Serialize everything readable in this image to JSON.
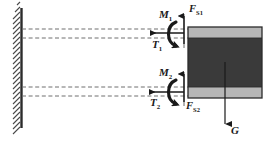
{
  "figure": {
    "type": "free-body-diagram",
    "title": "",
    "colors": {
      "wall_line": "#2b2b2b",
      "hatch": "#555555",
      "block_body": "#3a3a3a",
      "block_band": "#b6b6b6",
      "block_outline": "#2b2b2b",
      "dashed_line": "#6e6e6e",
      "arrow": "#1a1a1a",
      "label_text": "#1a1a1a",
      "background": "#ffffff"
    },
    "wall": {
      "label": "fixed-support-wall",
      "x": 21,
      "y_top": 8,
      "y_bottom": 128,
      "hatch_width": 9,
      "hatch_count": 26
    },
    "block": {
      "label": "body-block",
      "x": 188,
      "y": 27,
      "width": 74,
      "height": 71,
      "band_top_height": 11,
      "band_bottom_height": 11
    },
    "axes": [
      {
        "name": "upper-axis-line-1",
        "y": 29
      },
      {
        "name": "upper-axis-line-2",
        "y": 38
      },
      {
        "name": "lower-axis-line-1",
        "y": 87
      },
      {
        "name": "lower-axis-line-2",
        "y": 96
      }
    ],
    "labels": [
      {
        "id": "moment-upper",
        "name": "M1",
        "symbol": "M",
        "subscript": "1",
        "x": 159,
        "y": 9,
        "style": "main",
        "description": "Upper torsional moment"
      },
      {
        "id": "shear-upper",
        "name": "FS1",
        "symbol": "F",
        "subscript": "S1",
        "x": 189,
        "y": 4,
        "style": "force",
        "description": "Upper shear force"
      },
      {
        "id": "tension-upper",
        "name": "T1",
        "symbol": "T",
        "subscript": "1",
        "x": 152,
        "y": 39,
        "style": "main",
        "description": "Upper axial/tension force"
      },
      {
        "id": "moment-lower",
        "name": "M2",
        "symbol": "M",
        "subscript": "2",
        "x": 159,
        "y": 67,
        "style": "main",
        "description": "Lower torsional moment"
      },
      {
        "id": "tension-lower",
        "name": "T2",
        "symbol": "T",
        "subscript": "2",
        "x": 150,
        "y": 97,
        "style": "main",
        "description": "Lower axial/tension force"
      },
      {
        "id": "shear-lower",
        "name": "FS2",
        "symbol": "F",
        "subscript": "S2",
        "x": 186,
        "y": 101,
        "style": "force",
        "description": "Lower shear force"
      },
      {
        "id": "weight",
        "name": "G",
        "symbol": "G",
        "subscript": "",
        "x": 231,
        "y": 125,
        "style": "main",
        "description": "Weight of the block"
      }
    ],
    "arrows": {
      "upper_shear": {
        "name": "FS1-arrow",
        "direction": "up",
        "x": 184,
        "y_tail": 44,
        "y_head": 14
      },
      "upper_tension": {
        "name": "T1-arrow",
        "direction": "left",
        "y": 33,
        "x_tail": 184,
        "x_head": 147
      },
      "upper_moment": {
        "name": "M1-moment-arc",
        "direction": "counterclockwise"
      },
      "lower_shear": {
        "name": "FS2-arrow",
        "direction": "up",
        "x": 184,
        "y_tail": 104,
        "y_head": 72
      },
      "lower_tension": {
        "name": "T2-arrow",
        "direction": "left",
        "y": 92,
        "x_tail": 184,
        "x_head": 146
      },
      "lower_moment": {
        "name": "M2-moment-arc",
        "direction": "counterclockwise"
      },
      "weight": {
        "name": "G-arrow",
        "direction": "down",
        "x": 225,
        "y_tail": 62,
        "y_head": 127
      }
    }
  }
}
